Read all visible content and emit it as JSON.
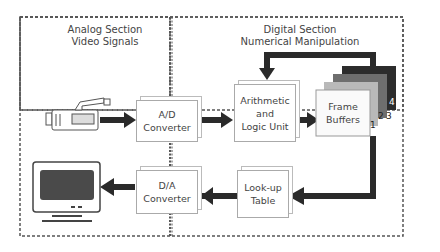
{
  "sections": {
    "analog": {
      "line1": "Analog Section",
      "line2": "Video Signals"
    },
    "digital": {
      "line1": "Digital Section",
      "line2": "Numerical Manipulation"
    }
  },
  "blocks": {
    "ad": {
      "line1": "A/D",
      "line2": "Converter"
    },
    "alu": {
      "line1": "Arithmetic",
      "line2": "and",
      "line3": "Logic Unit"
    },
    "frame": {
      "line1": "Frame",
      "line2": "Buffers"
    },
    "lut": {
      "line1": "Look-up",
      "line2": "Table"
    },
    "da": {
      "line1": "D/A",
      "line2": "Converter"
    }
  },
  "frame_buffer_numbers": [
    "1",
    "2",
    "3",
    "4"
  ],
  "icons": {
    "input": "video-camera-icon",
    "output": "monitor-icon"
  },
  "colors": {
    "arrow": "#2a2a2a",
    "border": "#555555",
    "fb1": "#f5f5f5",
    "fb2": "#b9b9b9",
    "fb3": "#6e6e6e",
    "fb4": "#2c2c2c"
  }
}
